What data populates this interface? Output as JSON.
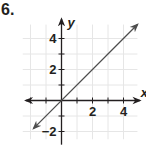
{
  "problem": {
    "number": "6."
  },
  "colors": {
    "axis": "#231f20",
    "grid": "#e6e6e6",
    "line": "#4d4d4d",
    "text": "#231f20"
  },
  "chart_data": {
    "type": "line",
    "title": "",
    "xlabel": "x",
    "ylabel": "y",
    "xlim": [
      -2.5,
      5
    ],
    "ylim": [
      -2.5,
      5
    ],
    "grid": true,
    "x_ticks": [
      -2,
      -1,
      0,
      1,
      2,
      3,
      4
    ],
    "y_ticks": [
      -2,
      -1,
      0,
      1,
      2,
      3,
      4
    ],
    "x_tick_labels": [
      {
        "value": 2,
        "label": "2"
      },
      {
        "value": 4,
        "label": "4"
      }
    ],
    "y_tick_labels": [
      {
        "value": 4,
        "label": "4"
      },
      {
        "value": 2,
        "label": "2"
      },
      {
        "value": -2,
        "label": "−2"
      }
    ],
    "series": [
      {
        "name": "y = x",
        "x": [
          -1.8,
          4.9
        ],
        "y": [
          -1.8,
          4.9
        ],
        "arrows": "both"
      }
    ]
  }
}
